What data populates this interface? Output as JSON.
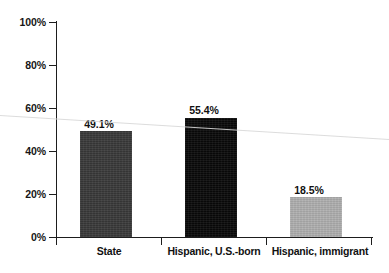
{
  "chart_data": {
    "type": "bar",
    "title": "",
    "subtitle": "",
    "xlabel": "",
    "ylabel": "",
    "categories": [
      "State",
      "Hispanic, U.S.-born",
      "Hispanic, immigrant"
    ],
    "values": [
      49.1,
      55.4,
      18.5
    ],
    "data_labels": [
      "49.1%",
      "55.4%",
      "18.5%"
    ],
    "ylim": [
      0,
      100
    ],
    "ytick_labels": [
      "0%",
      "20%",
      "40%",
      "60%",
      "80%",
      "100%"
    ],
    "ytick_values": [
      0,
      20,
      40,
      60,
      80,
      100
    ],
    "grid": false,
    "legend": false,
    "legend_position": "none",
    "bar_colors": [
      "#3a3a3a",
      "#0a0a0a",
      "#b0b0b0"
    ],
    "axis_color": "#1d1d1d",
    "background_color": "#ffffff",
    "annotations": []
  },
  "axis": {
    "y_ticks": [
      {
        "label": "100%",
        "value": 100
      },
      {
        "label": "80%",
        "value": 80
      },
      {
        "label": "60%",
        "value": 60
      },
      {
        "label": "40%",
        "value": 40
      },
      {
        "label": "20%",
        "value": 20
      },
      {
        "label": "0%",
        "value": 0
      }
    ]
  },
  "bars": [
    {
      "category": "State",
      "value": 49.1,
      "label": "49.1%",
      "color": "#3a3a3a"
    },
    {
      "category": "Hispanic, U.S.-born",
      "value": 55.4,
      "label": "55.4%",
      "color": "#0a0a0a"
    },
    {
      "category": "Hispanic, immigrant",
      "value": 18.5,
      "label": "18.5%",
      "color": "#b0b0b0"
    }
  ]
}
